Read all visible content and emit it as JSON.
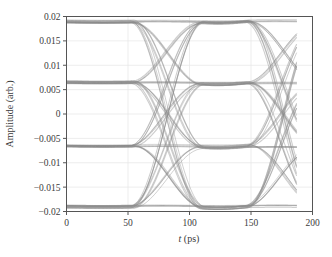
{
  "chart_data": {
    "type": "line",
    "title": "",
    "subtitle": "",
    "xlabel": "t (ps)",
    "xlabel_italic_part": "t",
    "xlabel_rest": " (ps)",
    "ylabel": "Amplitude (arb.)",
    "xlim": [
      0,
      200
    ],
    "ylim": [
      -0.02,
      0.02
    ],
    "xticks": [
      0,
      50,
      100,
      150,
      200
    ],
    "xtick_labels": [
      "0",
      "50",
      "100",
      "150",
      "200"
    ],
    "yticks": [
      -0.02,
      -0.015,
      -0.01,
      -0.005,
      0,
      0.005,
      0.01,
      0.015,
      0.02
    ],
    "ytick_labels": [
      "−0.02",
      "−0.015",
      "−0.01",
      "−0.005",
      "0",
      "0.005",
      "0.01",
      "0.015",
      "0.02"
    ],
    "grid": true,
    "grid_color": "#e8e8e8",
    "legend": "none",
    "trace_color": "#8a8a8a",
    "frame_color": "#555555",
    "background": "#ffffff",
    "data_extent_x": [
      0,
      187
    ],
    "symbol_period_ps": 94,
    "crossing_times_ps": [
      53,
      147
    ],
    "eye_center_ps": 100,
    "levels": [
      -0.019,
      -0.0065,
      0.0065,
      0.019
    ],
    "level_labels": [
      "level-0",
      "level-1",
      "level-2",
      "level-3"
    ],
    "n_traces": 64,
    "series": [
      {
        "name": "eye-traces",
        "description": "Superposition of many bit-sequence transitions between four amplitude levels",
        "x": [
          0,
          10,
          20,
          30,
          40,
          50,
          53,
          60,
          70,
          80,
          90,
          100,
          110,
          120,
          130,
          140,
          147,
          150,
          160,
          170,
          180,
          187
        ],
        "upper_envelope": [
          0.019,
          0.0188,
          0.018,
          0.0155,
          0.011,
          0.0035,
          0.0015,
          0.004,
          0.011,
          0.016,
          0.0188,
          0.019,
          0.0188,
          0.016,
          0.011,
          0.004,
          0.0015,
          0.0025,
          0.009,
          0.0145,
          0.0178,
          0.0185
        ],
        "lower_envelope": [
          -0.019,
          -0.0188,
          -0.018,
          -0.0155,
          -0.011,
          -0.0035,
          -0.0015,
          -0.004,
          -0.011,
          -0.016,
          -0.0188,
          -0.019,
          -0.0188,
          -0.016,
          -0.011,
          -0.004,
          -0.0015,
          -0.0025,
          -0.009,
          -0.0145,
          -0.0178,
          -0.0185
        ],
        "inner_upper": [
          0.0065,
          0.0065,
          0.0063,
          0.0055,
          0.004,
          0.0015,
          0.0005,
          0.0018,
          0.004,
          0.0058,
          0.0065,
          0.0065,
          0.0065,
          0.0058,
          0.004,
          0.0016,
          0.0005,
          0.0012,
          0.0035,
          0.0055,
          0.0064,
          0.0065
        ],
        "inner_lower": [
          -0.0065,
          -0.0065,
          -0.0063,
          -0.0055,
          -0.004,
          -0.0015,
          -0.0005,
          -0.0018,
          -0.004,
          -0.0058,
          -0.0065,
          -0.0065,
          -0.0065,
          -0.0058,
          -0.004,
          -0.0016,
          -0.0005,
          -0.0012,
          -0.0035,
          -0.0055,
          -0.0064,
          -0.0065
        ]
      }
    ]
  }
}
